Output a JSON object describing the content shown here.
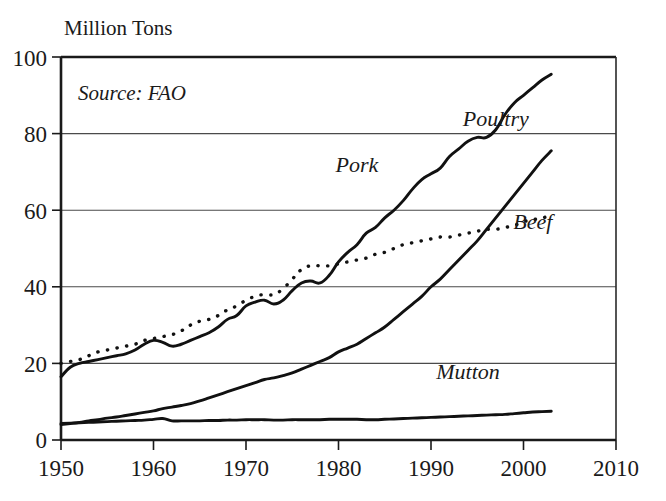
{
  "chart_data": {
    "type": "line",
    "title": "",
    "subtitle": "",
    "ylabel": "Million Tons",
    "xlabel": "",
    "source_note": "Source: FAO",
    "xlim": [
      1950,
      2010
    ],
    "ylim": [
      0,
      100
    ],
    "xticks": [
      1950,
      1960,
      1970,
      1980,
      1990,
      2000,
      2010
    ],
    "xtick_labels": [
      "1950",
      "1960",
      "1970",
      "1980",
      "1990",
      "2000",
      "2010"
    ],
    "yticks": [
      0,
      20,
      40,
      60,
      80,
      100
    ],
    "ytick_labels": [
      "0",
      "20",
      "40",
      "60",
      "80",
      "100"
    ],
    "grid": "horizontal",
    "legend_position": "inline-labels",
    "line_color": "#111111",
    "series": [
      {
        "name": "Pork",
        "label": "Pork",
        "style": "solid",
        "x": [
          1950,
          1951,
          1952,
          1953,
          1954,
          1955,
          1956,
          1957,
          1958,
          1959,
          1960,
          1961,
          1962,
          1963,
          1964,
          1965,
          1966,
          1967,
          1968,
          1969,
          1970,
          1971,
          1972,
          1973,
          1974,
          1975,
          1976,
          1977,
          1978,
          1979,
          1980,
          1981,
          1982,
          1983,
          1984,
          1985,
          1986,
          1987,
          1988,
          1989,
          1990,
          1991,
          1992,
          1993,
          1994,
          1995,
          1996,
          1997,
          1998,
          1999,
          2000,
          2001,
          2002,
          2003
        ],
        "values": [
          16.5,
          19.0,
          20.0,
          20.5,
          21.0,
          21.5,
          22.0,
          22.5,
          23.5,
          25.0,
          26.0,
          25.5,
          24.5,
          25.0,
          26.0,
          27.0,
          28.0,
          29.5,
          31.5,
          32.5,
          35.0,
          36.0,
          36.5,
          35.5,
          36.5,
          39.0,
          41.0,
          41.5,
          41.0,
          43.0,
          46.5,
          49.0,
          51.0,
          54.0,
          55.5,
          58.0,
          60.0,
          62.5,
          65.5,
          68.0,
          69.5,
          71.0,
          74.0,
          76.0,
          78.0,
          79.0,
          79.0,
          81.0,
          85.0,
          88.0,
          90.0,
          92.0,
          94.0,
          95.5
        ]
      },
      {
        "name": "Beef",
        "label": "Beef",
        "style": "dotted",
        "x": [
          1950,
          1951,
          1952,
          1953,
          1954,
          1955,
          1956,
          1957,
          1958,
          1959,
          1960,
          1961,
          1962,
          1963,
          1964,
          1965,
          1966,
          1967,
          1968,
          1969,
          1970,
          1971,
          1972,
          1973,
          1974,
          1975,
          1976,
          1977,
          1978,
          1979,
          1980,
          1981,
          1982,
          1983,
          1984,
          1985,
          1986,
          1987,
          1988,
          1989,
          1990,
          1991,
          1992,
          1993,
          1994,
          1995,
          1996,
          1997,
          1998,
          1999,
          2000,
          2001,
          2002,
          2003
        ],
        "values": [
          20.0,
          20.5,
          21.0,
          22.0,
          23.0,
          23.5,
          24.0,
          24.5,
          25.0,
          26.0,
          26.5,
          27.0,
          27.5,
          28.5,
          30.0,
          31.0,
          31.5,
          32.5,
          34.0,
          35.0,
          36.5,
          37.5,
          38.0,
          38.0,
          39.5,
          42.0,
          44.5,
          45.5,
          45.5,
          45.5,
          46.0,
          46.5,
          47.0,
          47.5,
          48.5,
          49.0,
          50.0,
          51.0,
          51.5,
          52.0,
          52.5,
          53.0,
          53.0,
          53.5,
          54.0,
          54.5,
          55.0,
          55.0,
          55.5,
          56.0,
          57.0,
          57.5,
          58.0,
          58.5
        ]
      },
      {
        "name": "Poultry",
        "label": "Poultry",
        "style": "solid",
        "x": [
          1950,
          1951,
          1952,
          1953,
          1954,
          1955,
          1956,
          1957,
          1958,
          1959,
          1960,
          1961,
          1962,
          1963,
          1964,
          1965,
          1966,
          1967,
          1968,
          1969,
          1970,
          1971,
          1972,
          1973,
          1974,
          1975,
          1976,
          1977,
          1978,
          1979,
          1980,
          1981,
          1982,
          1983,
          1984,
          1985,
          1986,
          1987,
          1988,
          1989,
          1990,
          1991,
          1992,
          1993,
          1994,
          1995,
          1996,
          1997,
          1998,
          1999,
          2000,
          2001,
          2002,
          2003
        ],
        "values": [
          4.0,
          4.3,
          4.6,
          5.0,
          5.3,
          5.7,
          6.0,
          6.4,
          6.8,
          7.2,
          7.6,
          8.2,
          8.6,
          9.0,
          9.5,
          10.2,
          11.0,
          11.8,
          12.6,
          13.4,
          14.2,
          15.0,
          15.8,
          16.2,
          16.8,
          17.5,
          18.5,
          19.5,
          20.5,
          21.5,
          23.0,
          24.0,
          25.0,
          26.5,
          28.0,
          29.5,
          31.5,
          33.5,
          35.5,
          37.5,
          40.0,
          42.0,
          44.5,
          47.0,
          49.5,
          52.0,
          55.0,
          58.0,
          61.0,
          64.0,
          67.0,
          70.0,
          73.0,
          75.5
        ]
      },
      {
        "name": "Mutton",
        "label": "Mutton",
        "style": "solid",
        "x": [
          1950,
          1951,
          1952,
          1953,
          1954,
          1955,
          1956,
          1957,
          1958,
          1959,
          1960,
          1961,
          1962,
          1963,
          1964,
          1965,
          1966,
          1967,
          1968,
          1969,
          1970,
          1971,
          1972,
          1973,
          1974,
          1975,
          1976,
          1977,
          1978,
          1979,
          1980,
          1981,
          1982,
          1983,
          1984,
          1985,
          1986,
          1987,
          1988,
          1989,
          1990,
          1991,
          1992,
          1993,
          1994,
          1995,
          1996,
          1997,
          1998,
          1999,
          2000,
          2001,
          2002,
          2003
        ],
        "values": [
          4.3,
          4.4,
          4.5,
          4.6,
          4.7,
          4.8,
          4.9,
          5.0,
          5.1,
          5.2,
          5.4,
          5.6,
          5.0,
          5.0,
          5.0,
          5.0,
          5.1,
          5.1,
          5.2,
          5.2,
          5.3,
          5.3,
          5.3,
          5.2,
          5.2,
          5.3,
          5.3,
          5.3,
          5.3,
          5.4,
          5.4,
          5.4,
          5.4,
          5.3,
          5.3,
          5.4,
          5.5,
          5.6,
          5.7,
          5.8,
          5.9,
          6.0,
          6.1,
          6.2,
          6.3,
          6.4,
          6.5,
          6.6,
          6.7,
          6.9,
          7.1,
          7.3,
          7.4,
          7.5
        ]
      }
    ],
    "annotations": [
      {
        "name": "pork-label",
        "text": "Pork",
        "x": 1982,
        "y": 70
      },
      {
        "name": "poultry-label",
        "text": "Poultry",
        "x": 1997,
        "y": 82
      },
      {
        "name": "beef-label",
        "text": "Beef",
        "x": 2001,
        "y": 55
      },
      {
        "name": "mutton-label",
        "text": "Mutton",
        "x": 1994,
        "y": 16
      }
    ]
  },
  "ylabel": {
    "text": "Million Tons"
  },
  "source": {
    "text": "Source: FAO"
  },
  "labels": {
    "pork": "Pork",
    "beef": "Beef",
    "poultry": "Poultry",
    "mutton": "Mutton"
  },
  "yticks": {
    "t0": "0",
    "t20": "20",
    "t40": "40",
    "t60": "60",
    "t80": "80",
    "t100": "100"
  },
  "xticks": {
    "t1950": "1950",
    "t1960": "1960",
    "t1970": "1970",
    "t1980": "1980",
    "t1990": "1990",
    "t2000": "2000",
    "t2010": "2010"
  }
}
